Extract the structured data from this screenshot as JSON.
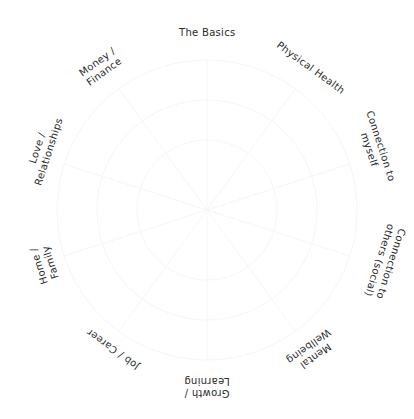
{
  "diagram": {
    "type": "wheel-of-life",
    "segments": [
      {
        "label": "The Basics",
        "x": 207,
        "y": 33,
        "rotate": 0
      },
      {
        "label": "Physical Health",
        "x": 310,
        "y": 68,
        "rotate": 36
      },
      {
        "label": "Connection to\nmyself",
        "x": 375,
        "y": 148,
        "rotate": 72
      },
      {
        "label": "Connection to\nothers (social)",
        "x": 385,
        "y": 262,
        "rotate": 108
      },
      {
        "label": "Mental\nWellbeing",
        "x": 312,
        "y": 351,
        "rotate": 144
      },
      {
        "label": "Growth /\nLearning",
        "x": 207,
        "y": 387,
        "rotate": 180
      },
      {
        "label": "Job / Career",
        "x": 113,
        "y": 349,
        "rotate": 216
      },
      {
        "label": "Home /\nFamily",
        "x": 45,
        "y": 264,
        "rotate": 252
      },
      {
        "label": "Love /\nRelationships",
        "x": 43,
        "y": 150,
        "rotate": 288
      },
      {
        "label": "Money /\nFinance",
        "x": 101,
        "y": 67,
        "rotate": 324
      }
    ]
  }
}
